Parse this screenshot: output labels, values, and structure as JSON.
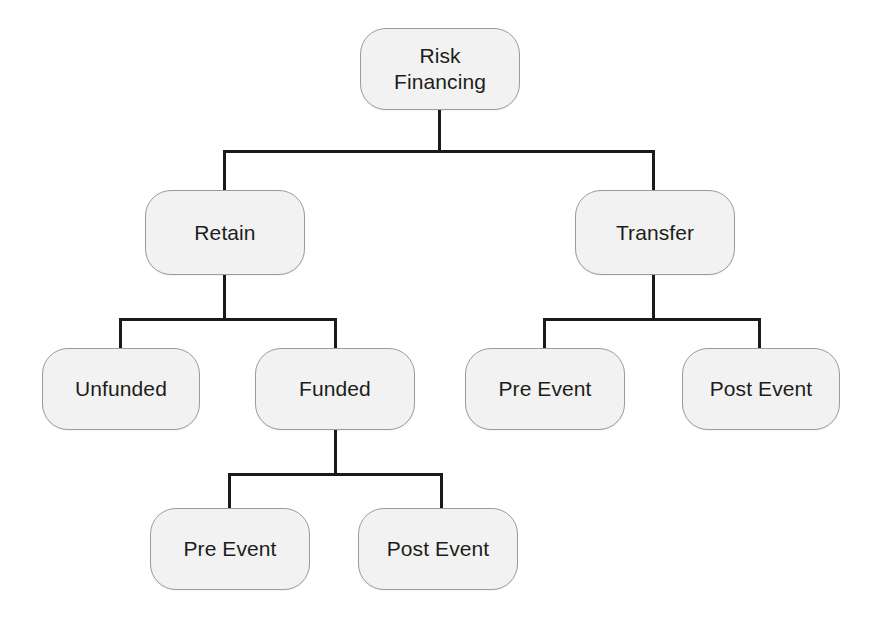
{
  "diagram": {
    "title": "Risk Financing",
    "type": "tree-hierarchy",
    "background_color": "#ffffff",
    "node_fill_color": "#f2f2f2",
    "node_border_color": "#9b9b9b",
    "connector_color": "#1a1a1a",
    "text_color": "#1d1d1b",
    "nodes": {
      "root": {
        "label": "Risk\nFinancing"
      },
      "retain": {
        "label": "Retain"
      },
      "transfer": {
        "label": "Transfer"
      },
      "unfunded": {
        "label": "Unfunded"
      },
      "funded": {
        "label": "Funded"
      },
      "transfer_pre_event": {
        "label": "Pre Event"
      },
      "transfer_post_event": {
        "label": "Post Event"
      },
      "funded_pre_event": {
        "label": "Pre Event"
      },
      "funded_post_event": {
        "label": "Post Event"
      }
    }
  }
}
